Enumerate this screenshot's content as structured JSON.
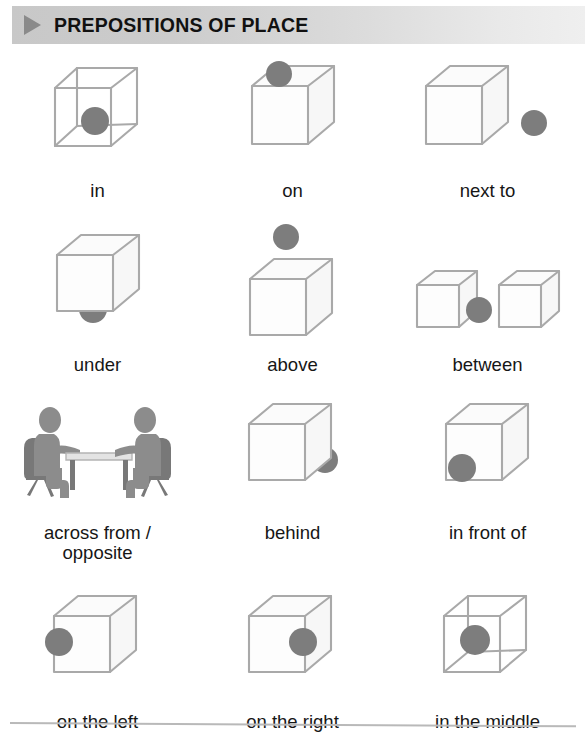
{
  "header": {
    "title": "PREPOSITIONS OF PLACE",
    "marker_icon": "triangle-right-icon",
    "bar_color_left": "#c8c8c8",
    "bar_color_right": "#efefef",
    "marker_color": "#8a8a8a"
  },
  "palette": {
    "ball_color": "#7d7d7d",
    "cube_stroke": "#a9a9a9",
    "cube_face": "#fdfdfd",
    "person_color": "#8c8c8c",
    "text_color": "#161616",
    "page_background": "#ffffff",
    "rule_color": "#b9b9b9"
  },
  "rows": [
    {
      "cells": [
        {
          "label": "in",
          "icon": "wireframe-cube-ball-inside-icon",
          "ball_position": "inside"
        },
        {
          "label": "on",
          "icon": "cube-ball-on-top-icon",
          "ball_position": "on-top"
        },
        {
          "label": "next to",
          "icon": "cube-ball-beside-icon",
          "ball_position": "right-of-cube"
        }
      ]
    },
    {
      "cells": [
        {
          "label": "under",
          "icon": "cube-ball-below-icon",
          "ball_position": "under-cube"
        },
        {
          "label": "above",
          "icon": "cube-ball-floating-above-icon",
          "ball_position": "above-cube"
        },
        {
          "label": "between",
          "icon": "two-cubes-ball-between-icon",
          "ball_position": "between-two-cubes"
        }
      ]
    },
    {
      "cells": [
        {
          "label": "across from /\nopposite",
          "icon": "two-people-at-table-icon",
          "ball_position": "none"
        },
        {
          "label": "behind",
          "icon": "cube-ball-behind-icon",
          "ball_position": "behind-cube-right"
        },
        {
          "label": "in front of",
          "icon": "cube-ball-in-front-icon",
          "ball_position": "front-bottom-left"
        }
      ]
    },
    {
      "cells": [
        {
          "label": "on the left",
          "icon": "cube-ball-left-edge-icon",
          "ball_position": "front-left-edge"
        },
        {
          "label": "on the right",
          "icon": "cube-ball-right-edge-icon",
          "ball_position": "front-right-edge"
        },
        {
          "label": "in the middle",
          "icon": "wireframe-cube-ball-center-icon",
          "ball_position": "center"
        }
      ]
    }
  ]
}
